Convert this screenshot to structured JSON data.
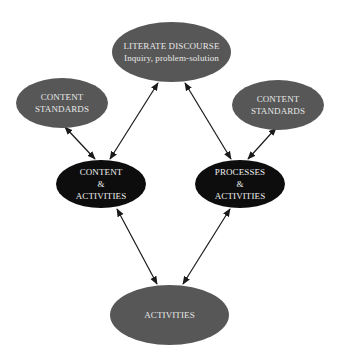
{
  "diagram": {
    "nodes": {
      "literate_discourse": {
        "line1": "LITERATE DISCOURSE",
        "line2": "Inquiry, problem-solution",
        "color": "#575757"
      },
      "content_standards_left": {
        "line1": "CONTENT",
        "line2": "STANDARDS",
        "color": "#575757"
      },
      "content_standards_right": {
        "line1": "CONTENT",
        "line2": "STANDARDS",
        "color": "#575757"
      },
      "content_activities": {
        "line1": "CONTENT",
        "line2": "&",
        "line3": "ACTIVITIES",
        "color": "#0d0d0d"
      },
      "processes_activities": {
        "line1": "PROCESSES",
        "line2": "&",
        "line3": "ACTIVITIES",
        "color": "#0d0d0d"
      },
      "activities": {
        "line1": "ACTIVITIES",
        "color": "#575757"
      }
    },
    "edges": [
      {
        "from": "literate_discourse",
        "to": "content_activities",
        "type": "bidirectional"
      },
      {
        "from": "literate_discourse",
        "to": "processes_activities",
        "type": "bidirectional"
      },
      {
        "from": "content_standards_left",
        "to": "content_activities",
        "type": "bidirectional"
      },
      {
        "from": "content_standards_right",
        "to": "processes_activities",
        "type": "bidirectional"
      },
      {
        "from": "content_activities",
        "to": "activities",
        "type": "bidirectional"
      },
      {
        "from": "processes_activities",
        "to": "activities",
        "type": "bidirectional"
      }
    ]
  }
}
